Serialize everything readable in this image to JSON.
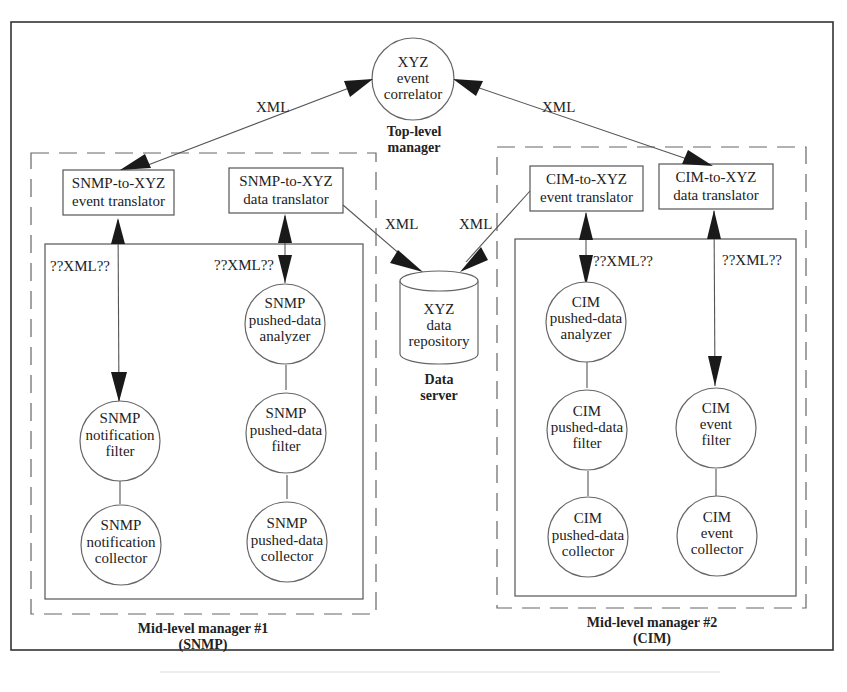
{
  "diagram": {
    "top_manager": {
      "node": [
        "XYZ",
        "event",
        "correlator"
      ],
      "label": [
        "Top-level",
        "manager"
      ]
    },
    "data_server": {
      "node": [
        "XYZ",
        "data",
        "repository"
      ],
      "label": [
        "Data",
        "server"
      ]
    },
    "edge_labels": {
      "xml_top_left": "XML",
      "xml_top_right": "XML",
      "xml_repo_left": "XML",
      "xml_repo_right": "XML",
      "qxml_snmp_event": "??XML??",
      "qxml_snmp_data": "??XML??",
      "qxml_cim_event": "??XML??",
      "qxml_cim_data": "??XML??"
    },
    "mid_manager_1": {
      "label": [
        "Mid-level manager #1",
        "(SNMP)"
      ],
      "event_translator": [
        "SNMP-to-XYZ",
        "event translator"
      ],
      "data_translator": [
        "SNMP-to-XYZ",
        "data translator"
      ],
      "notification_filter": [
        "SNMP",
        "notification",
        "filter"
      ],
      "notification_collector": [
        "SNMP",
        "notification",
        "collector"
      ],
      "pushed_data_analyzer": [
        "SNMP",
        "pushed-data",
        "analyzer"
      ],
      "pushed_data_filter": [
        "SNMP",
        "pushed-data",
        "filter"
      ],
      "pushed_data_collector": [
        "SNMP",
        "pushed-data",
        "collector"
      ]
    },
    "mid_manager_2": {
      "label": [
        "Mid-level manager #2",
        "(CIM)"
      ],
      "event_translator": [
        "CIM-to-XYZ",
        "event translator"
      ],
      "data_translator": [
        "CIM-to-XYZ",
        "data translator"
      ],
      "pushed_data_analyzer": [
        "CIM",
        "pushed-data",
        "analyzer"
      ],
      "pushed_data_filter": [
        "CIM",
        "pushed-data",
        "filter"
      ],
      "pushed_data_collector": [
        "CIM",
        "pushed-data",
        "collector"
      ],
      "event_filter": [
        "CIM",
        "event",
        "filter"
      ],
      "event_collector": [
        "CIM",
        "event",
        "collector"
      ]
    }
  }
}
